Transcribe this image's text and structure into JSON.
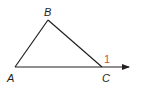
{
  "diagram": {
    "type": "triangle-exterior-angle",
    "vertices": [
      {
        "name": "A",
        "label": "A"
      },
      {
        "name": "B",
        "label": "B"
      },
      {
        "name": "C",
        "label": "C"
      }
    ],
    "angle_label": "1",
    "colors": {
      "line": "#231f20",
      "angle_label": "#c8553d"
    }
  }
}
